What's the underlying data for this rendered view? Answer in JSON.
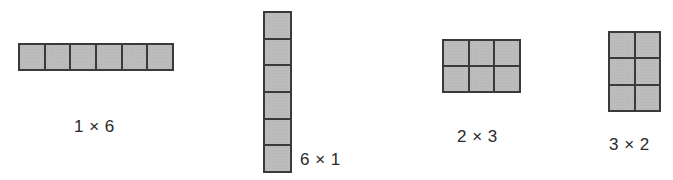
{
  "figure": {
    "colors": {
      "cell_fill": "#bcbcbc",
      "cell_border": "#3a3a3a",
      "background": "#ffffff"
    },
    "arrays": [
      {
        "id": "a1",
        "rows": 1,
        "cols": 6,
        "label": "1 × 6"
      },
      {
        "id": "a2",
        "rows": 6,
        "cols": 1,
        "label": "6 × 1"
      },
      {
        "id": "a3",
        "rows": 2,
        "cols": 3,
        "label": "2 × 3"
      },
      {
        "id": "a4",
        "rows": 3,
        "cols": 2,
        "label": "3 × 2"
      }
    ]
  }
}
